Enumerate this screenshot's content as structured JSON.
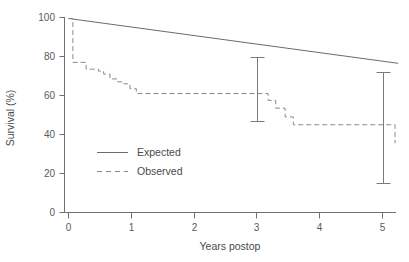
{
  "chart_data": {
    "type": "line",
    "title": "",
    "xlabel": "Years postop",
    "ylabel": "Survival (%)",
    "xlim": [
      0,
      5.25
    ],
    "ylim": [
      0,
      100
    ],
    "xticks": [
      0,
      1,
      2,
      3,
      4,
      5
    ],
    "xticklabels": [
      "0",
      "1",
      "2",
      "3",
      "4",
      "5"
    ],
    "yticks": [
      0,
      20,
      40,
      60,
      80,
      100
    ],
    "yticklabels": [
      "0",
      "20",
      "40",
      "60",
      "80",
      "100"
    ],
    "grid": false,
    "legend_position": "center-left",
    "series": [
      {
        "name": "Expected",
        "style": "solid",
        "color": "#6b6b6b",
        "x": [
          0.0,
          5.25
        ],
        "values": [
          99.5,
          76.5
        ]
      },
      {
        "name": "Observed",
        "style": "dashed",
        "color": "#8a8a8a",
        "step": "post",
        "x": [
          0.0,
          0.05,
          0.07,
          0.18,
          0.28,
          0.38,
          0.48,
          0.56,
          0.66,
          0.78,
          0.88,
          0.98,
          1.08,
          3.05,
          3.18,
          3.3,
          3.45,
          3.58,
          4.0,
          5.2
        ],
        "values": [
          99.5,
          99.5,
          77.0,
          77.0,
          73.5,
          73.5,
          72.5,
          71.0,
          68.5,
          67.0,
          66.0,
          63.5,
          61.0,
          61.0,
          57.5,
          53.5,
          49.0,
          45.0,
          45.0,
          35.5
        ]
      }
    ],
    "errorbars": [
      {
        "x": 3.0,
        "y": 61.0,
        "low": 47.0,
        "high": 79.5
      },
      {
        "x": 5.0,
        "y": 35.5,
        "low": 15.0,
        "high": 72.0
      }
    ],
    "legend": [
      {
        "label": "Expected",
        "style": "solid"
      },
      {
        "label": "Observed",
        "style": "dashed"
      }
    ]
  }
}
